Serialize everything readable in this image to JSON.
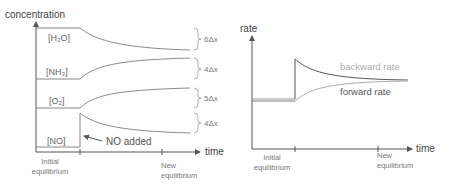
{
  "left_chart": {
    "y_axis_label": "concentration",
    "x_axis_label": "time",
    "x_ticks": [
      {
        "line1": "Initial",
        "line2": "equilibrium"
      },
      {
        "line1": "New",
        "line2": "equilibrium"
      }
    ],
    "species": [
      {
        "label": "[H₂O]",
        "change": "6Δx",
        "direction": "decrease"
      },
      {
        "label": "[NH₃]",
        "change": "4Δx",
        "direction": "increase"
      },
      {
        "label": "[O₂]",
        "change": "5Δx",
        "direction": "increase"
      },
      {
        "label": "[NO]",
        "change": "4Δx",
        "direction": "spike-then-decrease"
      }
    ],
    "annotation": "NO added"
  },
  "right_chart": {
    "y_axis_label": "rate",
    "x_axis_label": "time",
    "x_ticks": [
      {
        "line1": "Initial",
        "line2": "equilibrium"
      },
      {
        "line1": "New",
        "line2": "equilibrium"
      }
    ],
    "series": [
      {
        "label": "backward rate",
        "color": "#555555"
      },
      {
        "label": "forward rate",
        "color": "#aaaaaa"
      }
    ]
  },
  "colors": {
    "axis": "#555555",
    "curve": "#888888",
    "brace": "#999999"
  }
}
